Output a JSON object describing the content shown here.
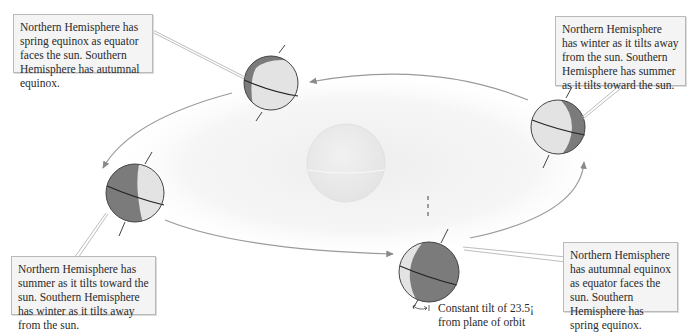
{
  "diagram": {
    "topic": "Earth's orbit and seasons",
    "colors": {
      "day_side": "#e3e3e3",
      "night_side": "#7b7b7b",
      "orbit_line": "#9a9a9a",
      "sun_fill": "#ececec",
      "callout_bg": "#f4f4f4",
      "callout_border": "#b9b9b9"
    },
    "callouts": [
      {
        "id": "spring-equinox",
        "position": "top-left",
        "text": "Northern Hemisphere has spring equinox as equator faces the sun. Southern Hemisphere has autumnal equinox."
      },
      {
        "id": "northern-winter",
        "position": "top-right",
        "text": "Northern Hemisphere has winter as it tilts away from the sun. Southern Hemisphere has summer as it tilts toward the sun."
      },
      {
        "id": "northern-summer",
        "position": "bottom-left",
        "text": "Northern Hemisphere has summer as it tilts toward the sun. Southern Hemisphere has winter as it tilts away from the sun."
      },
      {
        "id": "autumnal-equinox",
        "position": "bottom-right",
        "text": "Northern Hemisphere has autumnal equinox as equator faces the sun. Southern Hemisphere has spring equinox."
      }
    ],
    "tilt_label": {
      "line1": "Constant tilt of 23.5¡",
      "line2": "from plane of orbit"
    },
    "earth_positions": [
      {
        "name": "top",
        "cx": 271,
        "cy": 83,
        "r": 27
      },
      {
        "name": "left",
        "cx": 135,
        "cy": 193,
        "r": 29
      },
      {
        "name": "bottom",
        "cx": 429,
        "cy": 272,
        "r": 30
      },
      {
        "name": "right",
        "cx": 558,
        "cy": 127,
        "r": 27
      }
    ],
    "sun": {
      "cx": 346,
      "cy": 163,
      "r": 39
    }
  }
}
